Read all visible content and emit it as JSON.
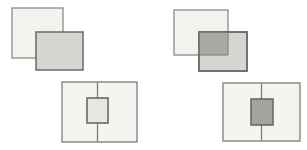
{
  "figure": {
    "background": "#ffffff"
  },
  "colors": {
    "back_square_fill": "#f2f2ee",
    "back_square_stroke": "#8a8a88",
    "front_square_fill": "#d5d5d2",
    "front_square_stroke": "#696967",
    "overlap_fill": "#a8a8a5",
    "panel_fill": "#f4f4f0",
    "panel_stroke": "#7d7d7b",
    "divider_stroke": "#7d7d7b",
    "inner_square_light_fill": "#e6e6e2",
    "inner_square_dark_fill": "#a3a3a0",
    "inner_square_stroke": "#696967"
  }
}
